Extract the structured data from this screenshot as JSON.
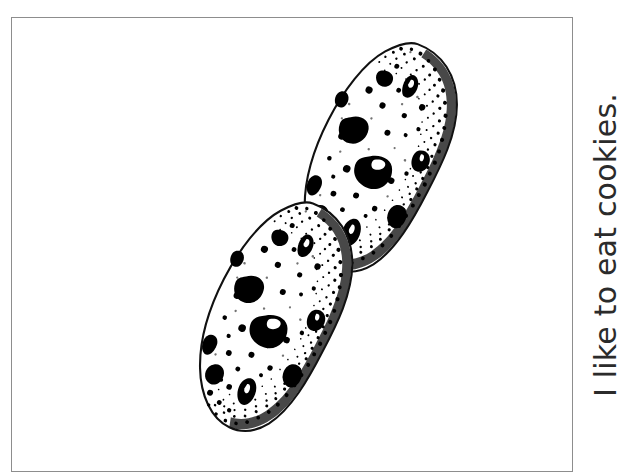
{
  "page": {
    "background_color": "#ffffff",
    "width": 630,
    "height": 476
  },
  "frame": {
    "name": "illustration-border",
    "border_color": "#8d8d8d",
    "border_width_px": 1,
    "fill_color": "#ffffff"
  },
  "caption": {
    "text": "I like to eat cookies.",
    "color": "#2b2b2b",
    "rotation_degrees": -90,
    "font_size_px": 30,
    "reading_direction": "bottom-to-top"
  },
  "illustration": {
    "title": "Two chocolate chip cookies",
    "style": "black-and-white pen-and-ink stipple drawing",
    "ink_color": "#000000",
    "paper_color": "#ffffff",
    "object_count": 2,
    "objects": [
      {
        "name": "upper-cookie",
        "shape": "ellipse",
        "center_x": 377,
        "center_y": 156,
        "radius_x": 62,
        "radius_y": 120,
        "rotation_degrees": 20,
        "chip_count": 11,
        "description": "Tilted oval cookie with large dark chocolate chips, scattered crumb specks and stippled shading along the lower-right rim"
      },
      {
        "name": "lower-cookie",
        "shape": "ellipse",
        "center_x": 272,
        "center_y": 316,
        "radius_x": 62,
        "radius_y": 120,
        "rotation_degrees": 20,
        "chip_count": 11,
        "description": "Tilted oval cookie identical in form to the upper one, offset down and to the left"
      }
    ]
  }
}
